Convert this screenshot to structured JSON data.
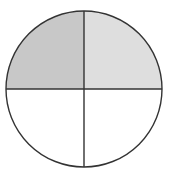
{
  "diagram": {
    "type": "fraction-circle",
    "total_parts": 4,
    "shaded_parts": 2,
    "circle": {
      "cx": 84,
      "cy": 89,
      "r": 78
    },
    "stroke_color": "#333333",
    "stroke_width": 1.4,
    "quadrants": [
      {
        "position": "top-left",
        "fill": "#c8c8c8",
        "shaded": true
      },
      {
        "position": "top-right",
        "fill": "#dedede",
        "shaded": true
      },
      {
        "position": "bottom-right",
        "fill": "#ffffff",
        "shaded": false
      },
      {
        "position": "bottom-left",
        "fill": "#ffffff",
        "shaded": false
      }
    ]
  }
}
